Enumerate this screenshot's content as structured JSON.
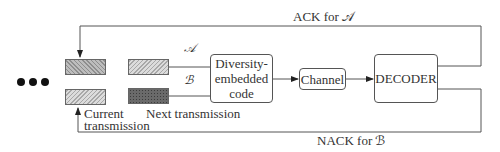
{
  "diagram": {
    "type": "block-diagram",
    "title": "",
    "ellipsis": "•••",
    "blocks": {
      "diversity_code": {
        "label_line1": "Diversity-",
        "label_line2": "embedded",
        "label_line3": "code"
      },
      "channel": {
        "label": "Channel"
      },
      "decoder": {
        "label": "DECODER"
      }
    },
    "streams": {
      "a_symbol": "𝒜",
      "b_symbol": "ℬ"
    },
    "labels": {
      "current_transmission_line1": "Current",
      "current_transmission_line2": "transmission",
      "next_transmission": "Next transmission",
      "ack": "ACK for 𝒜",
      "nack": "NACK for ℬ"
    },
    "edges": [
      {
        "from": "next-A-block",
        "to": "diversity_code"
      },
      {
        "from": "next-B-block",
        "to": "diversity_code"
      },
      {
        "from": "diversity_code",
        "to": "channel"
      },
      {
        "from": "channel",
        "to": "decoder"
      },
      {
        "from": "decoder",
        "to": "current-A-block",
        "label": "ACK for 𝒜"
      },
      {
        "from": "decoder",
        "to": "current-B-block",
        "label": "NACK for ℬ"
      }
    ]
  }
}
